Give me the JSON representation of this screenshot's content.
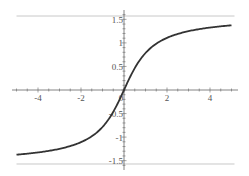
{
  "chart_data": {
    "type": "line",
    "title": "",
    "xlabel": "",
    "ylabel": "",
    "function": "arctan(x)",
    "xlim": [
      -5,
      5
    ],
    "ylim": [
      -1.5708,
      1.5708
    ],
    "grid": false,
    "legend": null,
    "x_ticks": [
      -4,
      -2,
      0,
      2,
      4
    ],
    "x_tick_labels": [
      "-4",
      "-2",
      "0",
      "2",
      "4"
    ],
    "y_ticks": [
      -1.5,
      -1,
      -0.5,
      0.5,
      1,
      1.5
    ],
    "y_tick_labels": [
      "-1.5",
      "-1",
      "-0.5",
      "0.5",
      "1",
      "1.5"
    ],
    "annotations": [
      "horizontal asymptote y = π/2",
      "horizontal asymptote y = -π/2"
    ],
    "series": [
      {
        "name": "arctan(x)",
        "color": "#333333",
        "x": [
          -5,
          -4,
          -3,
          -2,
          -1.5,
          -1,
          -0.5,
          0,
          0.5,
          1,
          1.5,
          2,
          3,
          4,
          5
        ],
        "y": [
          -1.373,
          -1.326,
          -1.249,
          -1.107,
          -0.983,
          -0.785,
          -0.464,
          0,
          0.464,
          0.785,
          0.983,
          1.107,
          1.249,
          1.326,
          1.373
        ]
      },
      {
        "name": "asymptote-top",
        "color": "#c0c0c0",
        "x": [
          -5,
          5
        ],
        "y": [
          1.5708,
          1.5708
        ]
      },
      {
        "name": "asymptote-bottom",
        "color": "#c0c0c0",
        "x": [
          -5,
          5
        ],
        "y": [
          -1.5708,
          -1.5708
        ]
      }
    ]
  },
  "colors": {
    "curve": "#333333",
    "asymptote": "#c8c8c8",
    "axis": "#666666"
  }
}
